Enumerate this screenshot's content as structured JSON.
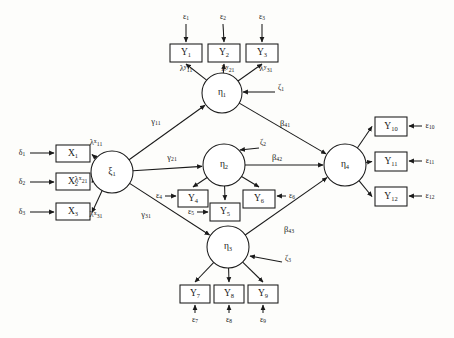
{
  "diagram": {
    "type": "sem-path-diagram",
    "stroke_color": "#1a1a1a",
    "background": "#fdfdfb"
  },
  "exogenous_latent": {
    "name": "xi-1",
    "label": "ξ",
    "sub": "1",
    "cx": 112,
    "cy": 172,
    "r": 21
  },
  "indicators_x": [
    {
      "label": "X",
      "sub": "1",
      "x": 56,
      "y": 145,
      "w": 34,
      "h": 17,
      "error": "δ",
      "error_sub": "1",
      "ex": 22,
      "ey": 153,
      "loading": "λ",
      "loading_sup": "x",
      "loading_sub": "11",
      "lx": 96,
      "ly": 143
    },
    {
      "label": "X",
      "sub": "2",
      "x": 56,
      "y": 173,
      "w": 34,
      "h": 17,
      "error": "δ",
      "error_sub": "2",
      "ex": 22,
      "ey": 182,
      "loading": "λ",
      "loading_sup": "x",
      "loading_sub": "21",
      "lx": 81,
      "ly": 180
    },
    {
      "label": "X",
      "sub": "3",
      "x": 56,
      "y": 203,
      "w": 34,
      "h": 17,
      "error": "δ",
      "error_sub": "3",
      "ex": 22,
      "ey": 212,
      "loading": "λ",
      "loading_sup": "x",
      "loading_sub": "31",
      "lx": 96,
      "ly": 215
    }
  ],
  "endogenous_latents": [
    {
      "name": "eta-1",
      "label": "η",
      "sub": "1",
      "cx": 222,
      "cy": 93,
      "r": 20,
      "disturbance": "ζ",
      "disturbance_sub": "1",
      "dx": 281,
      "dy": 88
    },
    {
      "name": "eta-2",
      "label": "η",
      "sub": "2",
      "cx": 224,
      "cy": 165,
      "r": 21,
      "disturbance": "ζ",
      "disturbance_sub": "2",
      "dx": 263,
      "dy": 143
    },
    {
      "name": "eta-3",
      "label": "η",
      "sub": "3",
      "cx": 228,
      "cy": 247,
      "r": 21,
      "disturbance": "ζ",
      "disturbance_sub": "3",
      "dx": 288,
      "dy": 259
    },
    {
      "name": "eta-4",
      "label": "η",
      "sub": "4",
      "cx": 345,
      "cy": 165,
      "r": 21,
      "disturbance": null,
      "disturbance_sub": null,
      "dx": 0,
      "dy": 0
    }
  ],
  "indicators_y": [
    {
      "label": "Y",
      "sub": "1",
      "x": 170,
      "y": 44,
      "w": 32,
      "h": 18,
      "error": "ε",
      "error_sub": "1",
      "ex": 186,
      "ey": 17,
      "loading": "λ",
      "loading_sup": "y",
      "loading_sub": "11",
      "lx": 186,
      "ly": 69
    },
    {
      "label": "Y",
      "sub": "2",
      "x": 208,
      "y": 44,
      "w": 32,
      "h": 18,
      "error": "ε",
      "error_sub": "2",
      "ex": 223,
      "ey": 17,
      "loading": "λ",
      "loading_sup": "y",
      "loading_sub": "21",
      "lx": 228,
      "ly": 69
    },
    {
      "label": "Y",
      "sub": "3",
      "x": 246,
      "y": 44,
      "w": 32,
      "h": 18,
      "error": "ε",
      "error_sub": "3",
      "ex": 262,
      "ey": 17,
      "loading": "λ",
      "loading_sup": "y",
      "loading_sub": "31",
      "lx": 266,
      "ly": 69
    },
    {
      "label": "Y",
      "sub": "4",
      "x": 178,
      "y": 190,
      "w": 30,
      "h": 17,
      "error": "ε",
      "error_sub": "4",
      "ex": 159,
      "ey": 196,
      "loading": null,
      "loading_sup": null,
      "loading_sub": null,
      "lx": 0,
      "ly": 0
    },
    {
      "label": "Y",
      "sub": "5",
      "x": 210,
      "y": 203,
      "w": 30,
      "h": 18,
      "error": "ε",
      "error_sub": "5",
      "ex": 191,
      "ey": 212,
      "loading": null,
      "loading_sup": null,
      "loading_sub": null,
      "lx": 0,
      "ly": 0
    },
    {
      "label": "Y",
      "sub": "6",
      "x": 243,
      "y": 190,
      "w": 32,
      "h": 18,
      "error": "ε",
      "error_sub": "6",
      "ex": 292,
      "ey": 196,
      "loading": null,
      "loading_sup": null,
      "loading_sub": null,
      "lx": 0,
      "ly": 0
    },
    {
      "label": "Y",
      "sub": "7",
      "x": 180,
      "y": 285,
      "w": 30,
      "h": 18,
      "error": "ε",
      "error_sub": "7",
      "ex": 195,
      "ey": 320,
      "loading": null,
      "loading_sup": null,
      "loading_sub": null,
      "lx": 0,
      "ly": 0
    },
    {
      "label": "Y",
      "sub": "8",
      "x": 214,
      "y": 285,
      "w": 30,
      "h": 18,
      "error": "ε",
      "error_sub": "8",
      "ex": 229,
      "ey": 320,
      "loading": null,
      "loading_sup": null,
      "loading_sub": null,
      "lx": 0,
      "ly": 0
    },
    {
      "label": "Y",
      "sub": "9",
      "x": 248,
      "y": 285,
      "w": 30,
      "h": 18,
      "error": "ε",
      "error_sub": "9",
      "ex": 263,
      "ey": 320,
      "loading": null,
      "loading_sup": null,
      "loading_sub": null,
      "lx": 0,
      "ly": 0
    },
    {
      "label": "Y",
      "sub": "10",
      "x": 375,
      "y": 117,
      "w": 32,
      "h": 19,
      "error": "ε",
      "error_sub": "10",
      "ex": 430,
      "ey": 126,
      "loading": null,
      "loading_sup": null,
      "loading_sub": null,
      "lx": 0,
      "ly": 0
    },
    {
      "label": "Y",
      "sub": "11",
      "x": 375,
      "y": 152,
      "w": 32,
      "h": 19,
      "error": "ε",
      "error_sub": "11",
      "ex": 430,
      "ey": 161,
      "loading": null,
      "loading_sup": null,
      "loading_sub": null,
      "lx": 0,
      "ly": 0
    },
    {
      "label": "Y",
      "sub": "12",
      "x": 375,
      "y": 187,
      "w": 32,
      "h": 19,
      "error": "ε",
      "error_sub": "12",
      "ex": 430,
      "ey": 196,
      "loading": null,
      "loading_sup": null,
      "loading_sub": null,
      "lx": 0,
      "ly": 0
    }
  ],
  "structural_paths": [
    {
      "name": "gamma-11",
      "label": "γ",
      "sub": "11",
      "x": 156,
      "y": 122,
      "from": "xi-1",
      "to": "eta-1"
    },
    {
      "name": "gamma-21",
      "label": "γ",
      "sub": "21",
      "x": 172,
      "y": 158,
      "from": "xi-1",
      "to": "eta-2"
    },
    {
      "name": "gamma-31",
      "label": "γ",
      "sub": "31",
      "x": 146,
      "y": 215,
      "from": "xi-1",
      "to": "eta-3"
    },
    {
      "name": "beta-41",
      "label": "β",
      "sub": "41",
      "x": 285,
      "y": 124,
      "from": "eta-1",
      "to": "eta-4"
    },
    {
      "name": "beta-42",
      "label": "β",
      "sub": "42",
      "x": 277,
      "y": 158,
      "from": "eta-2",
      "to": "eta-4"
    },
    {
      "name": "beta-43",
      "label": "β",
      "sub": "43",
      "x": 289,
      "y": 230,
      "from": "eta-3",
      "to": "eta-4"
    }
  ]
}
